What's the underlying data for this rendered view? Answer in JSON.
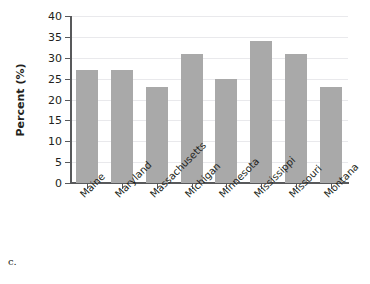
{
  "caption": "c.",
  "chart_data": {
    "type": "bar",
    "title": "",
    "xlabel": "",
    "ylabel": "Percent (%)",
    "categories": [
      "Maine",
      "Maryland",
      "Massachusetts",
      "Michigan",
      "Minnesota",
      "Mississippi",
      "Missouri",
      "Montana"
    ],
    "values": [
      27,
      27,
      23,
      31,
      25,
      34,
      31,
      23
    ],
    "ylim": [
      0,
      40
    ],
    "ytick_labels": [
      "0",
      "5",
      "10",
      "15",
      "20",
      "25",
      "30",
      "35",
      "40"
    ],
    "ytick_values": [
      0,
      5,
      10,
      15,
      20,
      25,
      30,
      35,
      40
    ],
    "grid": true,
    "legend": false,
    "bar_color": "#a9a9a9",
    "axis_color": "#58595b",
    "grid_color": "#e9e9ec"
  }
}
